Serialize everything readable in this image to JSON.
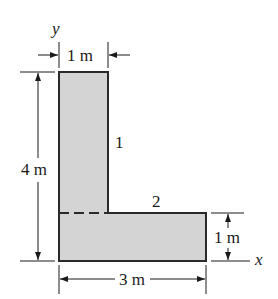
{
  "diagram": {
    "shape": "L-shaped composite area",
    "fill_color": "#d4d4d4",
    "stroke_color": "#2a2a2a",
    "axes": {
      "x_label": "x",
      "y_label": "y"
    },
    "parts": [
      {
        "id": "1",
        "label": "1",
        "description": "vertical rectangle 1 m × 4 m"
      },
      {
        "id": "2",
        "label": "2",
        "description": "horizontal rectangle 3 m × 1 m"
      }
    ],
    "dimensions": {
      "top_width": "1 m",
      "left_height": "4 m",
      "bottom_width": "3 m",
      "right_height": "1 m"
    }
  }
}
